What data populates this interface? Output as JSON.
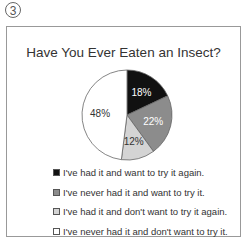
{
  "figure_marker": "3",
  "chart_data": {
    "type": "pie",
    "title": "Have You Ever Eaten an Insect?",
    "categories": [
      "I've had it and want to try it again.",
      "I've never had it and want to try it.",
      "I've had it and don't want to try it again.",
      "I've never had it and don't want to try it."
    ],
    "values": [
      18,
      22,
      12,
      48
    ],
    "labels": [
      "18%",
      "22%",
      "12%",
      "48%"
    ],
    "colors": [
      "#111111",
      "#8c8c8c",
      "#d4d4d4",
      "#ffffff"
    ],
    "label_colors": [
      "#ffffff",
      "#ffffff",
      "#333333",
      "#333333"
    ],
    "legend_position": "bottom",
    "start_angle": "12 o'clock, clockwise"
  }
}
